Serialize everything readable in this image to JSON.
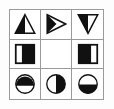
{
  "puzzle": {
    "title": "Matrix Reasoning Puzzle",
    "type": "3x3-matrix",
    "rows": 3,
    "columns": 3,
    "colors": {
      "fill": "#111111",
      "stroke": "#111111",
      "background": "#ffffff",
      "grid_line": "#9a9a9a",
      "page_background": "#fdfdfd"
    },
    "cells": [
      {
        "id": "cell-r1c1",
        "row": 1,
        "column": 1,
        "shape": "triangle",
        "orientation": "up",
        "shading": "left-half",
        "label": "triangle pointing up, left half black",
        "empty": false
      },
      {
        "id": "cell-r1c2",
        "row": 1,
        "column": 2,
        "shape": "triangle",
        "orientation": "right",
        "shading": "left-half",
        "label": "triangle pointing right, left half black",
        "empty": false
      },
      {
        "id": "cell-r1c3",
        "row": 1,
        "column": 3,
        "shape": "triangle",
        "orientation": "down",
        "shading": "left-half",
        "label": "triangle pointing down, left half black",
        "empty": false
      },
      {
        "id": "cell-r2c1",
        "row": 2,
        "column": 1,
        "shape": "square",
        "orientation": "upright",
        "shading": "right-portion",
        "label": "square, right portion black",
        "empty": false
      },
      {
        "id": "cell-r2c2",
        "row": 2,
        "column": 2,
        "shape": "none",
        "orientation": "none",
        "shading": "none",
        "label": "empty cell, missing piece",
        "empty": true
      },
      {
        "id": "cell-r2c3",
        "row": 2,
        "column": 3,
        "shape": "square",
        "orientation": "upright",
        "shading": "left-portion",
        "label": "square, left portion black",
        "empty": false
      },
      {
        "id": "cell-r3c1",
        "row": 3,
        "column": 1,
        "shape": "circle",
        "orientation": "upright",
        "shading": "top-portion",
        "label": "circle, top portion black",
        "empty": false
      },
      {
        "id": "cell-r3c2",
        "row": 3,
        "column": 2,
        "shape": "circle",
        "orientation": "upright",
        "shading": "right-half",
        "label": "circle, right half black",
        "empty": false
      },
      {
        "id": "cell-r3c3",
        "row": 3,
        "column": 3,
        "shape": "circle",
        "orientation": "upright",
        "shading": "bottom-portion",
        "label": "circle, bottom portion black",
        "empty": false
      }
    ]
  }
}
